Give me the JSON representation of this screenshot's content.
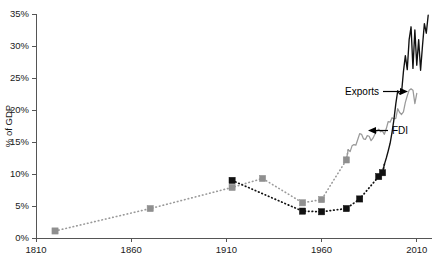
{
  "chart_data": {
    "type": "line",
    "title": "",
    "subtitle": "",
    "xlabel": "",
    "ylabel": "% of GDP",
    "xlim": [
      1810,
      2018
    ],
    "ylim": [
      0,
      35
    ],
    "grid": false,
    "legend_position": "inline-annotations",
    "x_ticks": [
      "1810",
      "1860",
      "1910",
      "1960",
      "2010"
    ],
    "x_tick_values": [
      1810,
      1860,
      1910,
      1960,
      2010
    ],
    "y_ticks": [
      "0%",
      "5%",
      "10%",
      "15%",
      "20%",
      "25%",
      "30%",
      "35%"
    ],
    "y_tick_values": [
      0,
      5,
      10,
      15,
      20,
      25,
      30,
      35
    ],
    "annotations": [
      {
        "label": "Exports",
        "arrow": "right",
        "points_to_series": "Exports"
      },
      {
        "label": "FDI",
        "arrow": "left",
        "points_to_series": "FDI"
      }
    ],
    "series": [
      {
        "name": "Exports",
        "color": "#9a9a9a",
        "style": "dotted-then-solid",
        "marker": "square",
        "marker_points": [
          {
            "x": 1820,
            "y": 1.1
          },
          {
            "x": 1870,
            "y": 4.6
          },
          {
            "x": 1913,
            "y": 7.9
          },
          {
            "x": 1929,
            "y": 9.3
          },
          {
            "x": 1950,
            "y": 5.5
          },
          {
            "x": 1960,
            "y": 6.0
          },
          {
            "x": 1973,
            "y": 12.2
          }
        ],
        "values": [
          {
            "x": 1974,
            "y": 13.8
          },
          {
            "x": 1975,
            "y": 13.5
          },
          {
            "x": 1976,
            "y": 14.4
          },
          {
            "x": 1977,
            "y": 14.6
          },
          {
            "x": 1978,
            "y": 14.5
          },
          {
            "x": 1979,
            "y": 15.4
          },
          {
            "x": 1980,
            "y": 16.3
          },
          {
            "x": 1981,
            "y": 16.2
          },
          {
            "x": 1982,
            "y": 15.5
          },
          {
            "x": 1983,
            "y": 15.4
          },
          {
            "x": 1984,
            "y": 16.0
          },
          {
            "x": 1985,
            "y": 15.9
          },
          {
            "x": 1986,
            "y": 15.2
          },
          {
            "x": 1987,
            "y": 15.6
          },
          {
            "x": 1988,
            "y": 16.2
          },
          {
            "x": 1989,
            "y": 16.7
          },
          {
            "x": 1990,
            "y": 17.0
          },
          {
            "x": 1991,
            "y": 16.6
          },
          {
            "x": 1992,
            "y": 16.7
          },
          {
            "x": 1993,
            "y": 16.2
          },
          {
            "x": 1994,
            "y": 17.1
          },
          {
            "x": 1995,
            "y": 18.2
          },
          {
            "x": 1996,
            "y": 18.1
          },
          {
            "x": 1997,
            "y": 18.8
          },
          {
            "x": 1998,
            "y": 18.6
          },
          {
            "x": 1999,
            "y": 18.7
          },
          {
            "x": 2000,
            "y": 20.2
          },
          {
            "x": 2001,
            "y": 19.6
          },
          {
            "x": 2002,
            "y": 19.3
          },
          {
            "x": 2003,
            "y": 19.7
          },
          {
            "x": 2004,
            "y": 21.2
          },
          {
            "x": 2005,
            "y": 22.2
          },
          {
            "x": 2006,
            "y": 23.1
          },
          {
            "x": 2007,
            "y": 23.3
          },
          {
            "x": 2008,
            "y": 23.1
          },
          {
            "x": 2009,
            "y": 21.0
          },
          {
            "x": 2010,
            "y": 22.6
          }
        ]
      },
      {
        "name": "FDI",
        "color": "#111111",
        "style": "dotted-then-solid",
        "marker": "square",
        "marker_points": [
          {
            "x": 1913,
            "y": 9.0
          },
          {
            "x": 1950,
            "y": 4.2
          },
          {
            "x": 1960,
            "y": 4.1
          },
          {
            "x": 1973,
            "y": 4.6
          },
          {
            "x": 1980,
            "y": 6.1
          },
          {
            "x": 1990,
            "y": 9.6
          },
          {
            "x": 1992,
            "y": 10.2
          }
        ],
        "values": [
          {
            "x": 1993,
            "y": 11.5
          },
          {
            "x": 1994,
            "y": 12.5
          },
          {
            "x": 1995,
            "y": 13.6
          },
          {
            "x": 1996,
            "y": 14.8
          },
          {
            "x": 1997,
            "y": 16.5
          },
          {
            "x": 1998,
            "y": 18.5
          },
          {
            "x": 1999,
            "y": 21.0
          },
          {
            "x": 2000,
            "y": 23.0
          },
          {
            "x": 2001,
            "y": 22.5
          },
          {
            "x": 2002,
            "y": 22.7
          },
          {
            "x": 2003,
            "y": 26.0
          },
          {
            "x": 2004,
            "y": 28.5
          },
          {
            "x": 2005,
            "y": 26.3
          },
          {
            "x": 2006,
            "y": 31.0
          },
          {
            "x": 2007,
            "y": 33.0
          },
          {
            "x": 2008,
            "y": 26.5
          },
          {
            "x": 2009,
            "y": 32.5
          },
          {
            "x": 2010,
            "y": 27.0
          },
          {
            "x": 2011,
            "y": 31.0
          },
          {
            "x": 2012,
            "y": 26.2
          },
          {
            "x": 2013,
            "y": 30.0
          },
          {
            "x": 2014,
            "y": 33.5
          },
          {
            "x": 2015,
            "y": 32.0
          },
          {
            "x": 2016,
            "y": 34.8
          }
        ]
      }
    ],
    "colors": {
      "exports": "#9a9a9a",
      "fdi": "#111111",
      "axis": "#555555",
      "text": "#1a1a1a",
      "background": "#ffffff"
    }
  }
}
